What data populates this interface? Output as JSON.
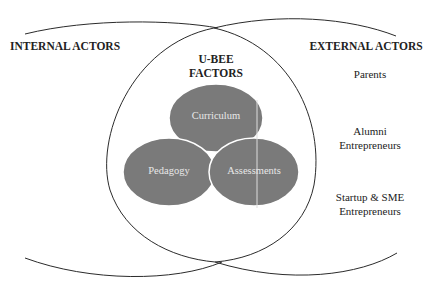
{
  "diagram": {
    "left_group": {
      "title": "INTERNAL ACTORS"
    },
    "center_group": {
      "title_line1": "U-BEE",
      "title_line2": "FACTORS"
    },
    "right_group": {
      "title": "EXTERNAL ACTORS",
      "items": [
        {
          "line1": "Parents",
          "line2": ""
        },
        {
          "line1": "Alumni",
          "line2": "Entrepreneurs"
        },
        {
          "line1": "Startup & SME",
          "line2": "Entrepreneurs"
        }
      ]
    },
    "factors": [
      {
        "label": "Curriculum"
      },
      {
        "label": "Pedagogy"
      },
      {
        "label": "Assessments"
      }
    ],
    "colors": {
      "ellipse_fill": "#7a7a7a",
      "ellipse_stroke": "#ffffff",
      "line": "#2b2b2b",
      "text": "#222222",
      "inner_text": "#e8e8e8"
    }
  }
}
